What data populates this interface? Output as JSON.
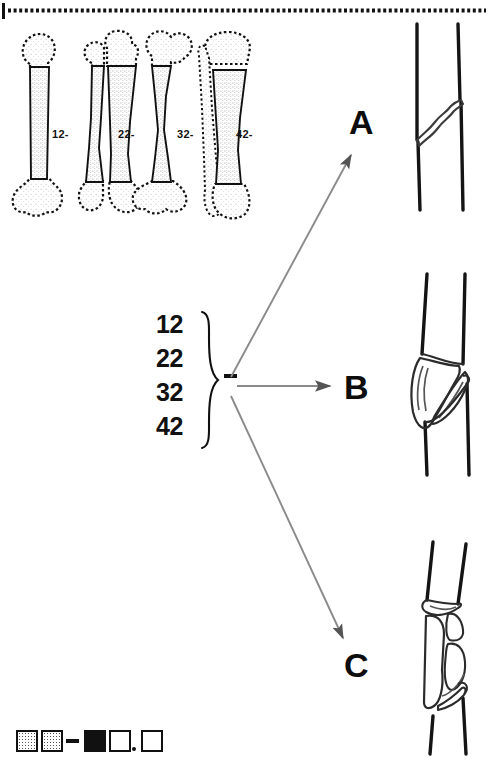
{
  "figure": {
    "background_color": "#ffffff",
    "ink_color": "#111111",
    "arrow_color": "#808080"
  },
  "bones": {
    "caption": "Long bone diaphyseal segments",
    "items": [
      {
        "id": "bone-12",
        "label": "12-",
        "name": "humerus",
        "segment_code": "12",
        "description": "humeral diaphysis, single shaft, stippled segment"
      },
      {
        "id": "bone-22",
        "label": "22-",
        "name": "radius-ulna",
        "segment_code": "22",
        "description": "forearm diaphysis, paired radius and ulna shafts, stippled segments"
      },
      {
        "id": "bone-32",
        "label": "32-",
        "name": "femur",
        "segment_code": "32",
        "description": "femoral diaphysis, single shaft with head and neck, stippled segment"
      },
      {
        "id": "bone-42",
        "label": "42-",
        "name": "tibia-fibula",
        "segment_code": "42",
        "description": "leg diaphysis, tibia shaft stippled with dotted fibula alongside"
      }
    ]
  },
  "brace_group": {
    "codes": [
      "12",
      "22",
      "32",
      "42"
    ],
    "dash": "-",
    "brace": "}"
  },
  "types": [
    {
      "letter": "A",
      "name": "simple-fracture",
      "description": "simple oblique fracture line, two fragments, single break"
    },
    {
      "letter": "B",
      "name": "wedge-fracture",
      "description": "wedge or butterfly fragment, contact between main fragments after reduction"
    },
    {
      "letter": "C",
      "name": "complex-fracture",
      "description": "complex comminuted fracture, multiple intermediate fragments"
    }
  ],
  "arrows": [
    {
      "name": "arrow-to-a",
      "target": "A",
      "direction": "up-right",
      "color": "#808080"
    },
    {
      "name": "arrow-to-b",
      "target": "B",
      "direction": "right",
      "color": "#808080"
    },
    {
      "name": "arrow-to-c",
      "target": "C",
      "direction": "down-right",
      "color": "#808080"
    }
  ],
  "legend": {
    "name": "coding-key",
    "items": [
      {
        "symbol": "stippled-square",
        "name": "bone-digit",
        "fill": "stipple"
      },
      {
        "symbol": "stippled-square",
        "name": "segment-digit",
        "fill": "stipple"
      },
      {
        "symbol": "dash",
        "name": "separator-dash",
        "fill": "solid"
      },
      {
        "symbol": "filled-square",
        "name": "type-letter",
        "fill": "black"
      },
      {
        "symbol": "open-square",
        "name": "group-digit",
        "fill": "white"
      },
      {
        "symbol": "dot",
        "name": "decimal-point",
        "fill": "solid"
      },
      {
        "symbol": "open-square",
        "name": "subgroup-digit",
        "fill": "white"
      }
    ]
  }
}
